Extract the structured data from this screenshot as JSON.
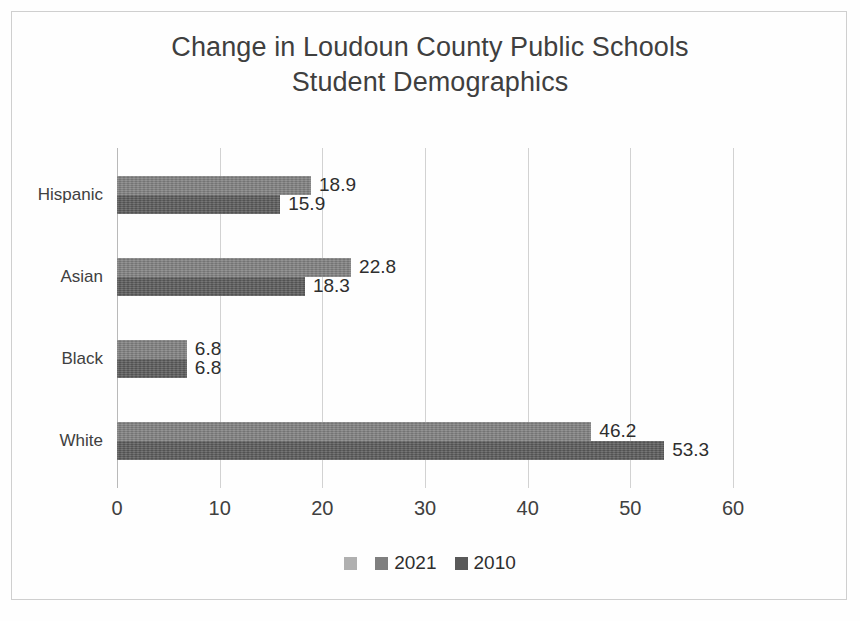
{
  "chart_data": {
    "type": "bar",
    "orientation": "horizontal",
    "title": "Change in Loudoun County Public Schools\nStudent Demographics",
    "title_line1": "Change in Loudoun County Public Schools",
    "title_line2": "Student Demographics",
    "categories": [
      "Hispanic",
      "Asian",
      "Black",
      "White"
    ],
    "series": [
      {
        "name": "2021",
        "color": "#7f7f7f",
        "values": [
          18.9,
          22.8,
          6.8,
          46.2
        ]
      },
      {
        "name": "2010",
        "color": "#595959",
        "values": [
          15.9,
          18.3,
          6.8,
          53.3
        ]
      }
    ],
    "xlabel": "",
    "ylabel": "",
    "xlim": [
      0,
      60
    ],
    "xticks": [
      0,
      10,
      20,
      30,
      40,
      50,
      60
    ],
    "xtick_labels": [
      "0",
      "10",
      "20",
      "30",
      "40",
      "50",
      "60"
    ],
    "grid": "vertical",
    "data_labels": [
      {
        "category": "Hispanic",
        "series": "2021",
        "text": "18.9"
      },
      {
        "category": "Hispanic",
        "series": "2010",
        "text": "15.9"
      },
      {
        "category": "Asian",
        "series": "2021",
        "text": "22.8"
      },
      {
        "category": "Asian",
        "series": "2010",
        "text": "18.3"
      },
      {
        "category": "Black",
        "series": "2021",
        "text": "6.8"
      },
      {
        "category": "Black",
        "series": "2010",
        "text": "6.8"
      },
      {
        "category": "White",
        "series": "2021",
        "text": "46.2"
      },
      {
        "category": "White",
        "series": "2010",
        "text": "53.3"
      }
    ],
    "legend": {
      "position": "bottom",
      "entries": [
        {
          "label": "",
          "color": "#b0b0b0"
        },
        {
          "label": "2021",
          "color": "#7f7f7f"
        },
        {
          "label": "2010",
          "color": "#595959"
        }
      ]
    },
    "colors": {
      "series_2021": "#7f7f7f",
      "series_2010": "#595959",
      "gridline": "#d2d2d2",
      "axis": "#b9b9b9",
      "frame": "#cfcfcf",
      "background": "#fefefe",
      "text": "#3f3f3f"
    }
  }
}
